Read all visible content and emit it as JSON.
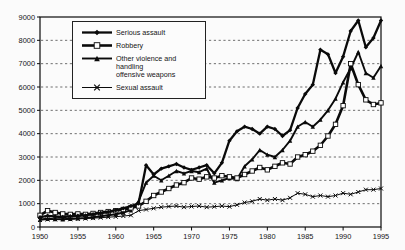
{
  "chart_data": {
    "type": "line",
    "title": "",
    "xlabel": "",
    "ylabel": "",
    "x": [
      1950,
      1951,
      1952,
      1953,
      1954,
      1955,
      1956,
      1957,
      1958,
      1959,
      1960,
      1961,
      1962,
      1963,
      1964,
      1965,
      1966,
      1967,
      1968,
      1969,
      1970,
      1971,
      1972,
      1973,
      1974,
      1975,
      1976,
      1977,
      1978,
      1979,
      1980,
      1981,
      1982,
      1983,
      1984,
      1985,
      1986,
      1987,
      1988,
      1989,
      1990,
      1991,
      1992,
      1993,
      1994,
      1995
    ],
    "xticks": [
      1950,
      1955,
      1960,
      1965,
      1970,
      1975,
      1980,
      1985,
      1990,
      1995
    ],
    "ylim": [
      0,
      9000
    ],
    "ytick_interval": 1000,
    "grid": "horizontal-dashed",
    "legend_position": "top-left-inside",
    "line_color": "#0a0a0a",
    "series": [
      {
        "name": "Serious assault",
        "marker": "diamond",
        "values": [
          420,
          480,
          450,
          430,
          460,
          480,
          500,
          550,
          600,
          650,
          720,
          800,
          900,
          1000,
          2650,
          2250,
          2500,
          2600,
          2700,
          2550,
          2450,
          2550,
          2650,
          2300,
          2750,
          3700,
          4100,
          4300,
          4200,
          4000,
          4300,
          4200,
          3900,
          4150,
          5100,
          5700,
          6100,
          7600,
          7400,
          6600,
          7300,
          8400,
          8850,
          7700,
          8100,
          8850
        ]
      },
      {
        "name": "Robbery",
        "marker": "square-open",
        "values": [
          500,
          700,
          620,
          560,
          540,
          560,
          540,
          580,
          620,
          660,
          700,
          750,
          820,
          900,
          1100,
          1350,
          1500,
          1650,
          1800,
          1900,
          2100,
          2050,
          2150,
          2100,
          2200,
          2150,
          2100,
          2250,
          2400,
          2550,
          2450,
          2600,
          2750,
          2700,
          3000,
          3100,
          3250,
          3500,
          3900,
          4400,
          5200,
          7000,
          6100,
          5450,
          5250,
          5320
        ]
      },
      {
        "name": "Other violence and handling offensive weapons",
        "label_lines": [
          "Other violence and handling",
          "offensive weapons"
        ],
        "marker": "triangle",
        "values": [
          320,
          350,
          340,
          330,
          350,
          370,
          390,
          420,
          460,
          500,
          550,
          620,
          720,
          1100,
          1900,
          2200,
          2000,
          2200,
          2400,
          2300,
          2400,
          2350,
          2500,
          1900,
          2000,
          2100,
          2050,
          2600,
          2900,
          3300,
          3100,
          3000,
          3300,
          3700,
          4300,
          4500,
          4300,
          4600,
          5000,
          5500,
          6200,
          6800,
          7500,
          6600,
          6400,
          6900
        ]
      },
      {
        "name": "Sexual assault",
        "marker": "x",
        "values": [
          300,
          320,
          330,
          340,
          330,
          350,
          360,
          380,
          400,
          420,
          440,
          470,
          500,
          700,
          750,
          800,
          850,
          880,
          900,
          850,
          880,
          900,
          850,
          870,
          900,
          870,
          950,
          1050,
          1100,
          1200,
          1150,
          1200,
          1150,
          1250,
          1450,
          1400,
          1300,
          1350,
          1300,
          1350,
          1450,
          1400,
          1500,
          1600,
          1600,
          1650
        ]
      }
    ]
  }
}
